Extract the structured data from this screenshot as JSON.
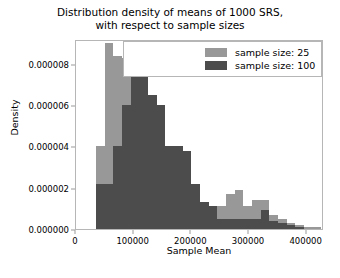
{
  "chart_data": {
    "type": "bar",
    "subtype": "histogram-overlay",
    "title": "Distribution density of means of 1000 SRS,\nwith respect to sample sizes",
    "xlabel": "Sample Mean",
    "ylabel": "Density",
    "xlim": [
      0,
      430000
    ],
    "ylim": [
      0,
      9.2e-06
    ],
    "xticks": [
      0,
      100000,
      200000,
      300000,
      400000
    ],
    "xtick_labels": [
      "0",
      "100000",
      "200000",
      "300000",
      "400000"
    ],
    "yticks": [
      0.0,
      2e-06,
      4e-06,
      6e-06,
      8e-06
    ],
    "ytick_labels": [
      "0.000000",
      "0.000002",
      "0.000004",
      "0.000006",
      "0.000008"
    ],
    "grid": false,
    "legend_position": "upper right",
    "bin_width": 15000,
    "bin_starts": [
      20000,
      35000,
      50000,
      65000,
      80000,
      95000,
      110000,
      125000,
      140000,
      155000,
      170000,
      185000,
      200000,
      215000,
      230000,
      245000,
      260000,
      275000,
      290000,
      305000,
      320000,
      335000,
      350000,
      365000,
      380000,
      395000,
      410000
    ],
    "series": [
      {
        "name": "sample size: 25",
        "color": "#989898",
        "values": [
          0.0,
          4e-06,
          9e-06,
          8.4e-06,
          8.3e-06,
          8e-06,
          7.4e-06,
          6.5e-06,
          6e-06,
          4e-06,
          4e-06,
          3.8e-06,
          2.2e-06,
          1.3e-06,
          1.1e-06,
          1.1e-06,
          1.7e-06,
          1.9e-06,
          1.1e-06,
          1.4e-06,
          1.4e-06,
          7e-07,
          5e-07,
          3e-07,
          2e-07,
          1e-07,
          1e-07
        ]
      },
      {
        "name": "sample size: 100",
        "color": "#4c4c4c",
        "values": [
          0.0,
          2.2e-06,
          2.2e-06,
          4e-06,
          6e-06,
          8.3e-06,
          7.4e-06,
          6.5e-06,
          6e-06,
          4e-06,
          4e-06,
          3.8e-06,
          2.2e-06,
          1.3e-06,
          1.1e-06,
          5e-07,
          5e-07,
          5e-07,
          5e-07,
          5e-07,
          9e-07,
          4e-07,
          3e-07,
          2e-07,
          1e-07,
          0.0,
          0.0
        ]
      }
    ],
    "legend": [
      {
        "label": "sample size: 25",
        "color": "#989898"
      },
      {
        "label": "sample size: 100",
        "color": "#4c4c4c"
      }
    ]
  }
}
